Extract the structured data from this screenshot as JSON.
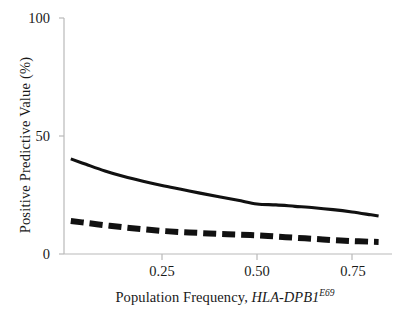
{
  "chart_data": {
    "type": "line",
    "title": "",
    "xlabel_plain": "Population Frequency, HLA-DPB1E69",
    "xlabel_prefix": "Population Frequency, ",
    "xlabel_gene": "HLA-DPB1",
    "xlabel_superscript": "E69",
    "ylabel": "Positive Predictive Value (%)",
    "xlim": [
      0.0,
      0.85
    ],
    "ylim": [
      0,
      100
    ],
    "xticks": [
      0.25,
      0.5,
      0.75
    ],
    "xtick_labels": [
      "0.25",
      "0.50",
      "0.75"
    ],
    "yticks": [
      0,
      50,
      100
    ],
    "ytick_labels": [
      "0",
      "50",
      "100"
    ],
    "grid": false,
    "legend": "none",
    "series": [
      {
        "name": "solid-curve",
        "style": "solid",
        "color": "#111111",
        "x": [
          0.01,
          0.05,
          0.1,
          0.15,
          0.2,
          0.25,
          0.3,
          0.35,
          0.4,
          0.45,
          0.5,
          0.55,
          0.6,
          0.65,
          0.7,
          0.75,
          0.8,
          0.82
        ],
        "y": [
          40.3,
          38.0,
          35.2,
          32.8,
          30.8,
          29.0,
          27.4,
          25.8,
          24.3,
          22.8,
          21.2,
          20.8,
          20.2,
          19.6,
          18.8,
          17.8,
          16.6,
          16.1
        ]
      },
      {
        "name": "dashed-curve",
        "style": "dashed",
        "color": "#111111",
        "x": [
          0.01,
          0.05,
          0.1,
          0.15,
          0.2,
          0.25,
          0.3,
          0.35,
          0.4,
          0.45,
          0.5,
          0.55,
          0.6,
          0.65,
          0.7,
          0.75,
          0.8,
          0.82
        ],
        "y": [
          14.0,
          13.2,
          12.2,
          11.3,
          10.5,
          9.8,
          9.3,
          8.9,
          8.5,
          8.2,
          7.9,
          7.4,
          6.9,
          6.4,
          5.9,
          5.5,
          5.2,
          5.1
        ]
      }
    ]
  },
  "axes": {
    "axis_color": "#b9b9b9",
    "ink_color": "#111111"
  }
}
